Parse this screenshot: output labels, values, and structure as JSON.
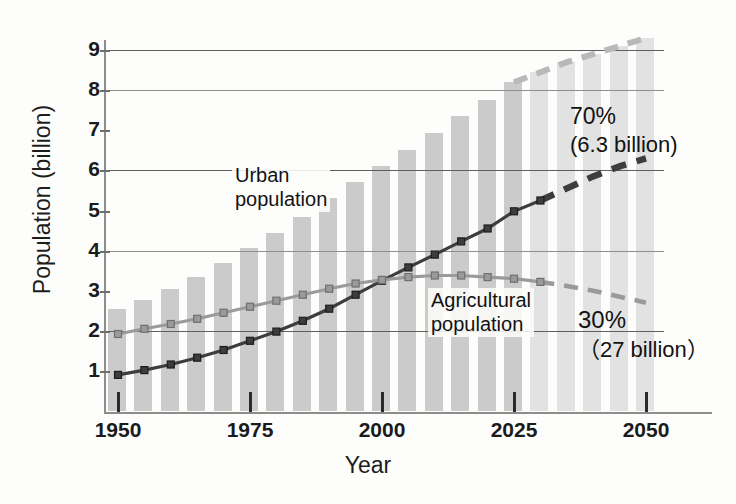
{
  "chart_data": {
    "type": "line",
    "title": "",
    "subtitle": "",
    "xlabel": "Year",
    "ylabel": "Population (billion)",
    "xlim": [
      1950,
      2052
    ],
    "ylim": [
      0,
      9.3
    ],
    "grid": true,
    "gridlines_y": [
      2,
      4,
      6,
      8,
      9
    ],
    "y_ticks": [
      1,
      2,
      3,
      4,
      5,
      6,
      7,
      8,
      9
    ],
    "x_ticks": [
      1950,
      1975,
      2000,
      2025,
      2050
    ],
    "legend_position": "inline-annotations",
    "bars": {
      "name": "Total world population",
      "color": "#cbcbcb",
      "projected_color": "#e2e2e2",
      "x": [
        1950,
        1955,
        1960,
        1965,
        1970,
        1975,
        1980,
        1985,
        1990,
        1995,
        2000,
        2005,
        2010,
        2015,
        2020,
        2025,
        2030,
        2035,
        2040,
        2045,
        2050
      ],
      "values": [
        2.55,
        2.78,
        3.04,
        3.35,
        3.7,
        4.07,
        4.45,
        4.85,
        5.3,
        5.72,
        6.12,
        6.51,
        6.93,
        7.35,
        7.76,
        8.2,
        8.45,
        8.7,
        8.9,
        9.1,
        9.3
      ],
      "projected_from": 2030
    },
    "series": [
      {
        "name": "Urban population",
        "color": "#3d3d3d",
        "style_observed": "solid-with-markers",
        "style_projected": "dashed",
        "x": [
          1950,
          1955,
          1960,
          1965,
          1970,
          1975,
          1980,
          1985,
          1990,
          1995,
          2000,
          2005,
          2010,
          2015,
          2020,
          2025,
          2030,
          2035,
          2040,
          2045,
          2050
        ],
        "values": [
          0.9,
          1.02,
          1.16,
          1.33,
          1.52,
          1.75,
          1.98,
          2.25,
          2.55,
          2.9,
          3.25,
          3.58,
          3.9,
          4.23,
          4.55,
          4.98,
          5.25,
          5.55,
          5.85,
          6.1,
          6.3
        ],
        "projected_from": 2030,
        "endpoint_label": "6.3 billion"
      },
      {
        "name": "Agricultural population",
        "color": "#9a9a9a",
        "style_observed": "solid-with-markers",
        "style_projected": "dashed",
        "x": [
          1950,
          1955,
          1960,
          1965,
          1970,
          1975,
          1980,
          1985,
          1990,
          1995,
          2000,
          2005,
          2010,
          2015,
          2020,
          2025,
          2030,
          2035,
          2040,
          2045,
          2050
        ],
        "values": [
          1.92,
          2.05,
          2.17,
          2.3,
          2.45,
          2.6,
          2.75,
          2.9,
          3.05,
          3.18,
          3.27,
          3.34,
          3.38,
          3.38,
          3.34,
          3.3,
          3.22,
          3.12,
          3.0,
          2.85,
          2.7
        ],
        "projected_from": 2030
      }
    ],
    "annotations": [
      {
        "id": "urban",
        "text": "Urban\npopulation",
        "points_to": "Urban population series"
      },
      {
        "id": "agricultural",
        "text": "Agricultural\npopulation",
        "points_to": "Agricultural population series"
      },
      {
        "id": "share-urban",
        "value": "70%",
        "detail": "(6.3 billion)"
      },
      {
        "id": "share-agricultural",
        "value": "30%",
        "detail": "（27 billion）"
      }
    ]
  },
  "axes": {
    "y_title": "Population (billion)",
    "x_title": "Year",
    "y_tick_labels": [
      "9",
      "8",
      "7",
      "6",
      "5",
      "4",
      "3",
      "2",
      "1"
    ],
    "x_tick_labels": [
      "1950",
      "1975",
      "2000",
      "2025",
      "2050"
    ]
  },
  "annotations": {
    "urban_line1": "Urban",
    "urban_line2": "population",
    "agri_line1": "Agricultural",
    "agri_line2": "population",
    "share_urban_pct": "70%",
    "share_urban_detail": "(6.3 billion)",
    "share_agri_pct": "30%",
    "share_agri_detail": "（27 billion）"
  },
  "colors": {
    "bar": "#cbcbcb",
    "bar_projected": "#e2e2e2",
    "urban_line": "#3d3d3d",
    "agricultural_line": "#9a9a9a",
    "grid": "#5f605e",
    "text": "#1b1b1b"
  }
}
